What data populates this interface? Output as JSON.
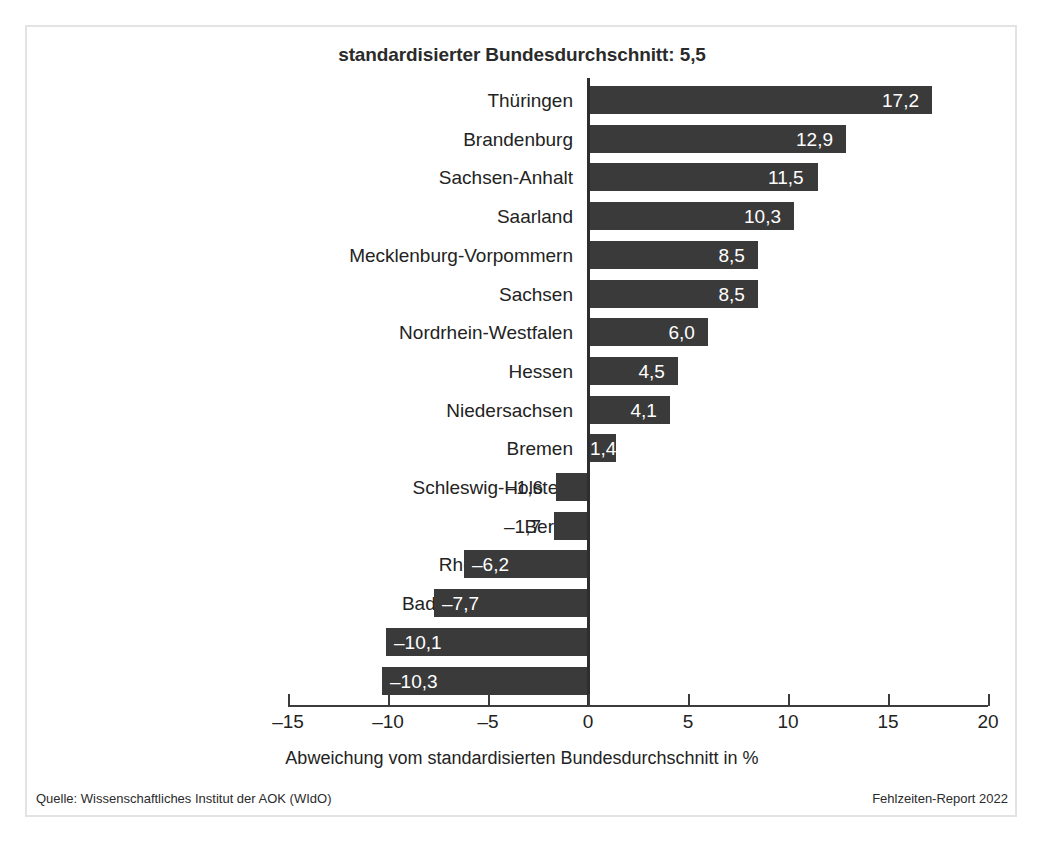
{
  "chart_data": {
    "type": "bar",
    "orientation": "horizontal",
    "title": "standardisierter Bundesdurchschnitt: 5,5",
    "xlabel": "Abweichung vom standardisierten Bundesdurchschnitt in %",
    "ylabel": "",
    "xlim": [
      -15,
      20
    ],
    "xticks": [
      -15,
      -10,
      -5,
      0,
      5,
      10,
      15,
      20
    ],
    "xtick_labels": [
      "–15",
      "–10",
      "–5",
      "0",
      "5",
      "10",
      "15",
      "20"
    ],
    "grid": false,
    "legend": null,
    "bar_color": "#3a3a3a",
    "reference_value": 5.5,
    "categories": [
      "Thüringen",
      "Brandenburg",
      "Sachsen-Anhalt",
      "Saarland",
      "Mecklenburg-Vorpommern",
      "Sachsen",
      "Nordrhein-Westfalen",
      "Hessen",
      "Niedersachsen",
      "Bremen",
      "Schleswig-Holstein",
      "Berlin",
      "Rheinland-Pfalz",
      "Baden-Württemberg",
      "Hamburg",
      "Bayern"
    ],
    "values": [
      17.2,
      12.9,
      11.5,
      10.3,
      8.5,
      8.5,
      6.0,
      4.5,
      4.1,
      1.4,
      -1.6,
      -1.7,
      -6.2,
      -7.7,
      -10.1,
      -10.3
    ],
    "value_labels": [
      "17,2",
      "12,9",
      "11,5",
      "10,3",
      "8,5",
      "8,5",
      "6,0",
      "4,5",
      "4,1",
      "1,4",
      "–1,6",
      "–1,7",
      "–6,2",
      "–7,7",
      "–10,1",
      "–10,3"
    ]
  },
  "footer": {
    "source": "Quelle: Wissenschaftliches Institut der AOK (WIdO)",
    "report": "Fehlzeiten-Report 2022"
  }
}
